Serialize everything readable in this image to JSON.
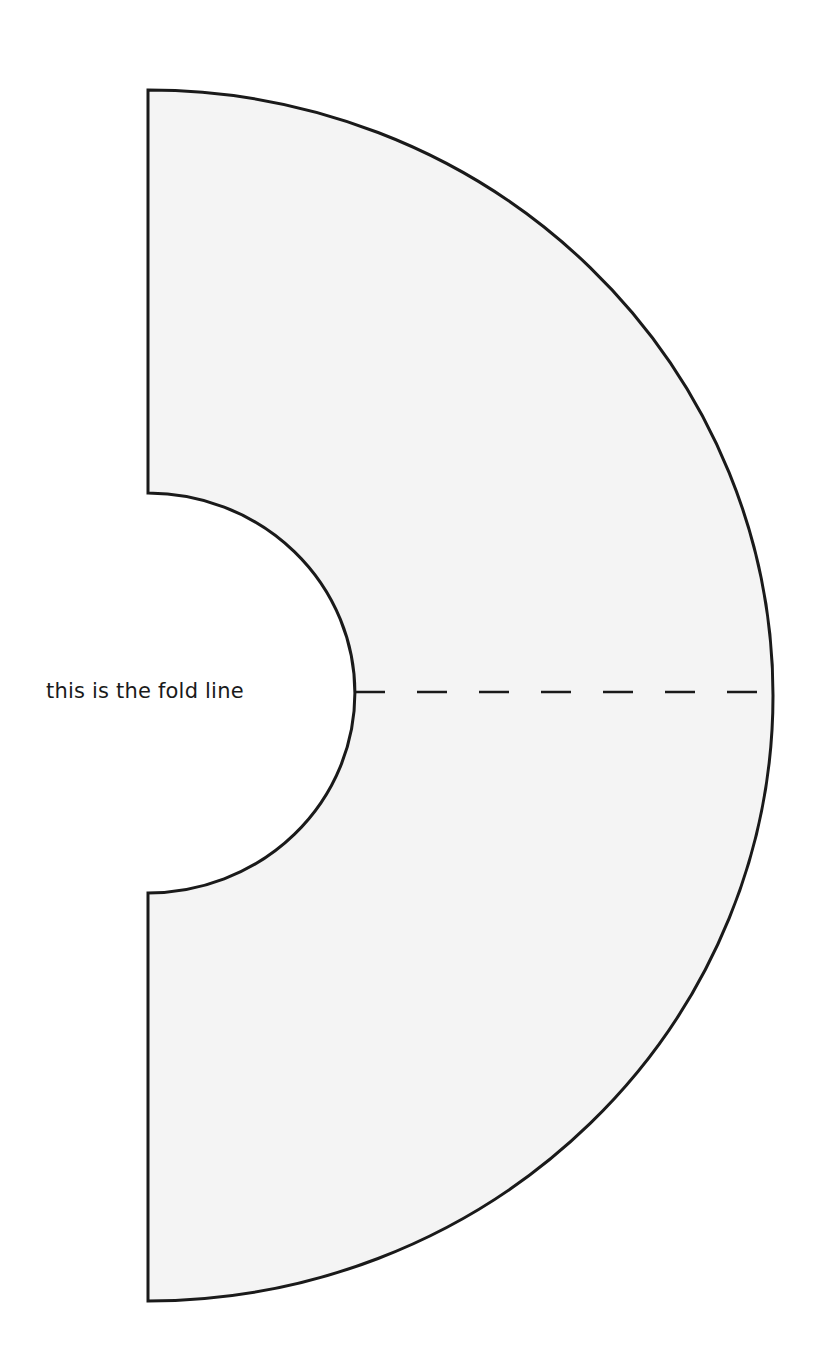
{
  "diagram": {
    "type": "sewing-pattern-half-collar",
    "fold_label": "this is the fold line",
    "colors": {
      "fill": "#f4f4f4",
      "stroke": "#1a1a1a",
      "background": "#ffffff"
    },
    "shape": {
      "center": [
        148,
        692
      ],
      "outer_extent": {
        "top": 90,
        "bottom": 1301,
        "right": 773
      },
      "inner_extent": {
        "top": 493,
        "bottom": 893,
        "right": 355
      }
    },
    "fold_line": {
      "x1": 355,
      "x2": 773,
      "y": 692,
      "style": "dashed"
    }
  }
}
